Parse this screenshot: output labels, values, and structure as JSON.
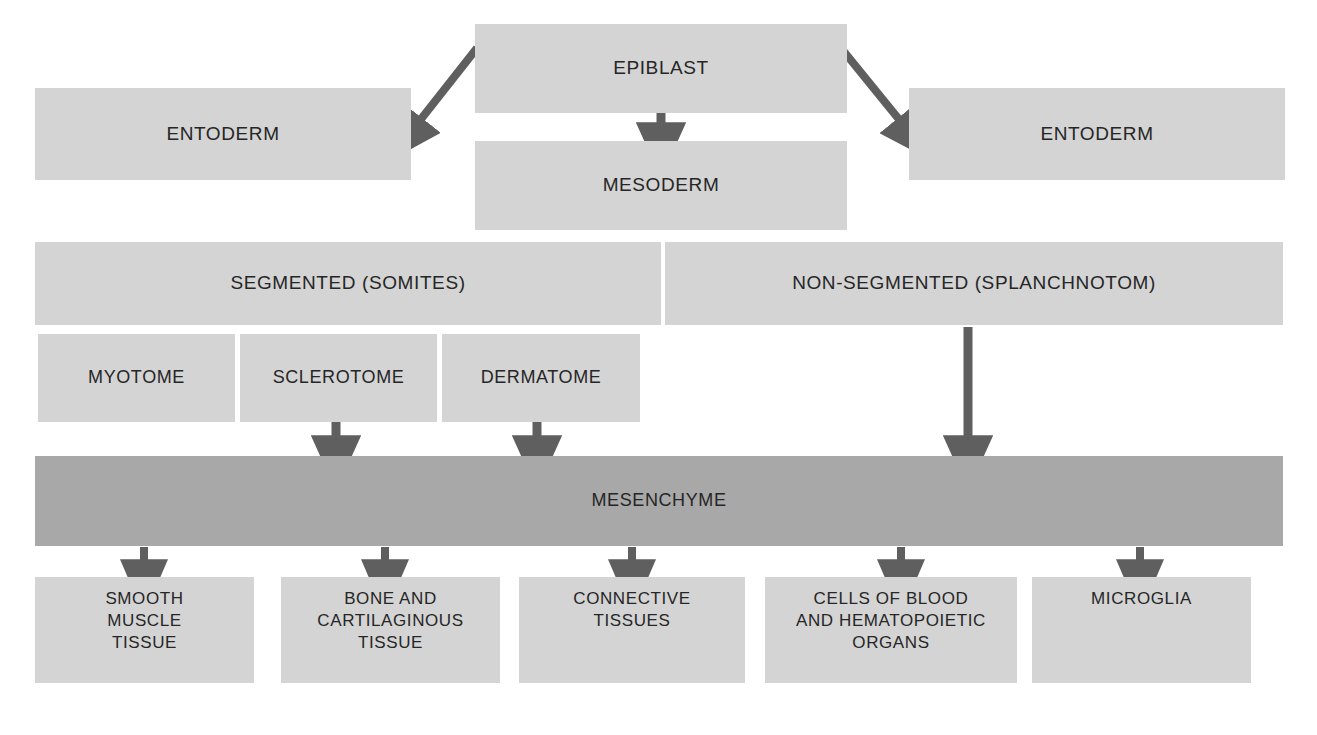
{
  "diagram": {
    "colors": {
      "box_light": "#d4d4d4",
      "box_dark": "#a8a8a8",
      "arrow": "#5f5f5f",
      "text": "#262626",
      "background": "#ffffff"
    },
    "nodes": {
      "epiblast": "EPIBLAST",
      "entoderm_left": "ENTODERM",
      "entoderm_right": "ENTODERM",
      "mesoderm": "MESODERM",
      "segmented": "SEGMENTED (SOMITES)",
      "non_segmented": "NON-SEGMENTED (SPLANCHNOTOM)",
      "myotome": "MYOTOME",
      "sclerotome": "SCLEROTOME",
      "dermatome": "DERMATOME",
      "mesenchyme": "MESENCHYME",
      "derivative_1": "SMOOTH\nMUSCLE\nTISSUE",
      "derivative_2": "BONE AND\nCARTILAGINOUS\nTISSUE",
      "derivative_3": "CONNECTIVE\nTISSUES",
      "derivative_4": "CELLS OF BLOOD\nAND HEMATOPOIETIC\nORGANS",
      "derivative_5": "MICROGLIA"
    },
    "arrows": [
      {
        "name": "epiblast-to-entoderm-left",
        "kind": "diagonal"
      },
      {
        "name": "epiblast-to-mesoderm",
        "kind": "vertical-short"
      },
      {
        "name": "epiblast-to-entoderm-right",
        "kind": "diagonal"
      },
      {
        "name": "sclerotome-to-mesenchyme",
        "kind": "vertical-short"
      },
      {
        "name": "dermatome-to-mesenchyme",
        "kind": "vertical-short"
      },
      {
        "name": "splanchnotom-to-mesenchyme",
        "kind": "vertical-long"
      },
      {
        "name": "mesenchyme-to-derivative-1",
        "kind": "vertical-short"
      },
      {
        "name": "mesenchyme-to-derivative-2",
        "kind": "vertical-short"
      },
      {
        "name": "mesenchyme-to-derivative-3",
        "kind": "vertical-short"
      },
      {
        "name": "mesenchyme-to-derivative-4",
        "kind": "vertical-short"
      },
      {
        "name": "mesenchyme-to-derivative-5",
        "kind": "vertical-short"
      }
    ]
  }
}
